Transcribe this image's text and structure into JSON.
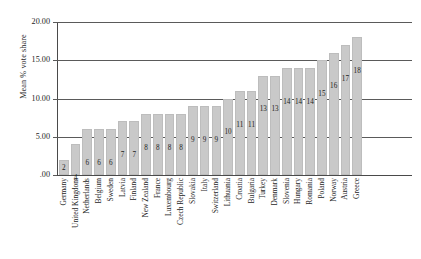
{
  "chart_data": {
    "type": "bar",
    "title": "",
    "xlabel": "",
    "ylabel": "Mean % vote share",
    "ylim": [
      0,
      20
    ],
    "grid": true,
    "legend": "none",
    "orientation": "vertical",
    "bar_color": "#c9c9c9",
    "axis_color": "#4a4a4a",
    "y_ticks": [
      "20.00",
      "15.00",
      "10.00",
      "5.00",
      ".00"
    ],
    "y_tick_values": [
      20,
      15,
      10,
      5,
      0
    ],
    "categories": [
      "Germany",
      "United Kingdom",
      "Netherlands",
      "Belgium",
      "Sweden",
      "Latvia",
      "Finland",
      "New Zealand",
      "France",
      "Luxembourg",
      "Czech Republic",
      "Slovakia",
      "Italy",
      "Switzerland",
      "Lithuania",
      "Croatia",
      "Bulgaria",
      "Turkey",
      "Denmark",
      "Slovenia",
      "Hungary",
      "Romania",
      "Poland",
      "Norway",
      "Austria",
      "Greece"
    ],
    "values": [
      2,
      4,
      6,
      6,
      6,
      7,
      7,
      8,
      8,
      8,
      8,
      9,
      9,
      9,
      10,
      11,
      11,
      13,
      13,
      14,
      14,
      14,
      15,
      16,
      17,
      18
    ],
    "data_labels": [
      "2",
      "4",
      "6",
      "6",
      "6",
      "7",
      "7",
      "8",
      "8",
      "8",
      "8",
      "9",
      "9",
      "9",
      "10",
      "11",
      "11",
      "13",
      "13",
      "14",
      "14",
      "14",
      "15",
      "16",
      "17",
      "18"
    ]
  }
}
